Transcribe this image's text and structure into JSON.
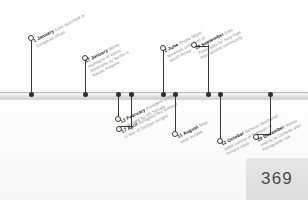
{
  "page": {
    "folio": "369",
    "orientation": "landscape"
  },
  "timeline": {
    "axis_label": "timeline-bar",
    "events": [
      {
        "id": "euro-launch",
        "side": "up",
        "date": "1 January",
        "desc_line1": "Euro launched in",
        "desc_line2": "European Union",
        "desc_line3": "",
        "x": 31,
        "stem": 55,
        "elbow": 0
      },
      {
        "id": "racak-massacre",
        "side": "up",
        "date": "17 January",
        "desc_line1": "Worst",
        "desc_line2": "massacre of ethnic",
        "desc_line3": "Albanians by Serbs in",
        "desc_line4": "Racak, Kosovo",
        "x": 85,
        "stem": 35,
        "elbow": 0
      },
      {
        "id": "clinton-acquitted",
        "side": "down",
        "date": "12 February",
        "desc_line1": "President Clinton",
        "desc_line2": "acquitted by US Senate",
        "desc_line3": "",
        "x": 118,
        "stem": 20,
        "elbow": 0
      },
      {
        "id": "kosovo-refugees",
        "side": "down",
        "date": "17 April",
        "desc_line1": "Refugees flee Kosovo",
        "desc_line2": "in fear of Serbian purges",
        "desc_line3": "",
        "x": 131,
        "stem": 30,
        "elbow": 12
      },
      {
        "id": "mbeki-president",
        "side": "up",
        "date": "2 June",
        "desc_line1": "Thabo Mbeki",
        "desc_line2": "becomes president of",
        "desc_line3": "South Africa",
        "x": 163,
        "stem": 45,
        "elbow": 0
      },
      {
        "id": "solar-eclipse",
        "side": "down",
        "date": "11 August",
        "desc_line1": "Total",
        "desc_line2": "solar eclipse",
        "desc_line3": "",
        "x": 175,
        "stem": 35,
        "elbow": 0
      },
      {
        "id": "east-timor-appeal",
        "side": "up",
        "date": "20 September",
        "desc_line1": "East",
        "desc_line2": "Timor asks for help from",
        "desc_line3": "international community",
        "x": 208,
        "stem": 48,
        "elbow": 14
      },
      {
        "id": "musharraf-coup",
        "side": "down",
        "date": "12 October",
        "desc_line1": "General Musharraf",
        "desc_line2": "takes control of Pakistan in",
        "desc_line3": "military coup",
        "x": 220,
        "stem": 42,
        "elbow": 0
      },
      {
        "id": "macau-handover",
        "side": "down",
        "date": "20 December",
        "desc_line1": "Macau",
        "desc_line2": "reverts to Chinese after",
        "desc_line3": "Portuguese rule",
        "x": 270,
        "stem": 38,
        "elbow": 14
      }
    ]
  },
  "colors": {
    "ink": "#161616",
    "muted": "#8e8e8e",
    "stem": "#3a3a3a",
    "bar_light": "#f4f4f4",
    "bar_dark": "#cfcfcf",
    "folio_bg": "#e0e0e0",
    "folio_text": "#4a4a4a"
  }
}
